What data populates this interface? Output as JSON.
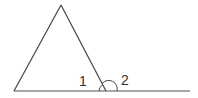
{
  "diagram": {
    "type": "geometry",
    "stroke_color": "#555555",
    "baseline_color": "#888888",
    "labels": {
      "angle1": "1",
      "angle2": "2"
    },
    "points": {
      "apex": [
        61,
        5
      ],
      "left_base": [
        14,
        91
      ],
      "right_vertex": [
        106,
        91
      ],
      "line_end": [
        190,
        91
      ]
    }
  }
}
